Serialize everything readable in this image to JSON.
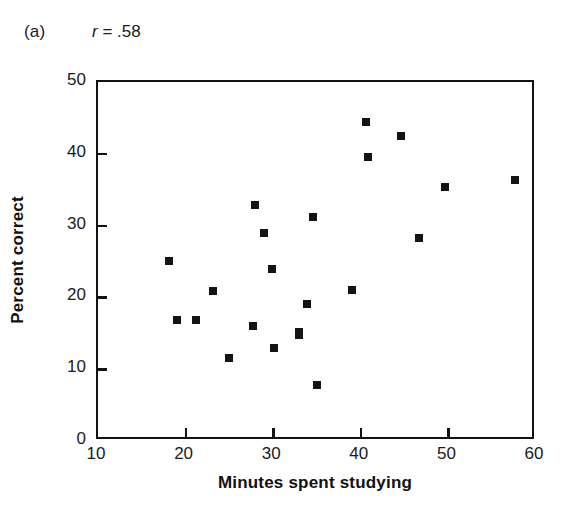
{
  "figure": {
    "panel_label": "(a)",
    "annotation_prefix": "r",
    "annotation_rest": " = .58",
    "marker_color": "#141414",
    "axis_color": "#121212",
    "background": "#ffffff"
  },
  "chart_data": {
    "type": "scatter",
    "title": "",
    "subtitle": "",
    "xlabel": "Minutes spent studying",
    "ylabel": "Percent correct",
    "xlim": [
      10,
      60
    ],
    "ylim": [
      0,
      50
    ],
    "xticks": [
      10,
      20,
      30,
      40,
      50,
      60
    ],
    "yticks": [
      0,
      10,
      20,
      30,
      40,
      50
    ],
    "xtick_labels": [
      "10",
      "20",
      "30",
      "40",
      "50",
      "60"
    ],
    "ytick_labels": [
      "0",
      "10",
      "20",
      "30",
      "40",
      "50"
    ],
    "grid": false,
    "legend": null,
    "annotations": [
      {
        "text": "(a)",
        "role": "panel-label"
      },
      {
        "text": "r = .58",
        "role": "correlation",
        "value": 0.58
      }
    ],
    "series": [
      {
        "name": "Study time vs accuracy",
        "marker": "square",
        "color": "#141414",
        "points": [
          {
            "x": 18.1,
            "y": 25.1
          },
          {
            "x": 19.0,
            "y": 16.9
          },
          {
            "x": 21.2,
            "y": 16.9
          },
          {
            "x": 23.1,
            "y": 20.9
          },
          {
            "x": 25.0,
            "y": 11.6
          },
          {
            "x": 27.7,
            "y": 16.0
          },
          {
            "x": 27.9,
            "y": 32.9
          },
          {
            "x": 28.9,
            "y": 29.0
          },
          {
            "x": 29.9,
            "y": 24.0
          },
          {
            "x": 30.1,
            "y": 13.0
          },
          {
            "x": 32.9,
            "y": 14.8
          },
          {
            "x": 33.0,
            "y": 15.2
          },
          {
            "x": 33.9,
            "y": 19.1
          },
          {
            "x": 34.5,
            "y": 31.2
          },
          {
            "x": 35.0,
            "y": 7.8
          },
          {
            "x": 39.0,
            "y": 21.1
          },
          {
            "x": 40.6,
            "y": 44.4
          },
          {
            "x": 40.8,
            "y": 39.5
          },
          {
            "x": 44.6,
            "y": 42.5
          },
          {
            "x": 46.7,
            "y": 28.3
          },
          {
            "x": 49.6,
            "y": 35.4
          },
          {
            "x": 57.6,
            "y": 36.4
          }
        ]
      }
    ]
  }
}
